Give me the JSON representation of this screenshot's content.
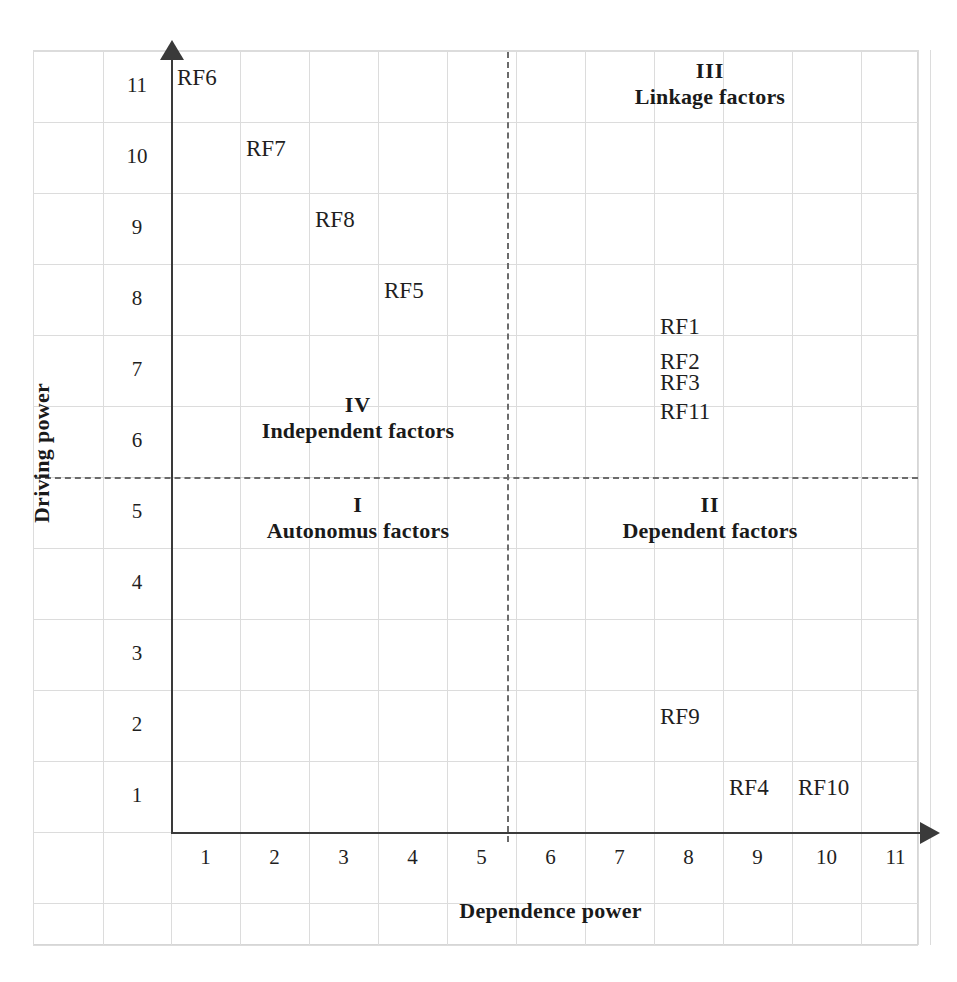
{
  "chart_data": {
    "type": "scatter",
    "title": "",
    "xlabel": "Dependence power",
    "ylabel": "Driving power",
    "xlim": [
      0,
      11
    ],
    "ylim": [
      0,
      11
    ],
    "xticks": [
      "1",
      "2",
      "3",
      "4",
      "5",
      "6",
      "7",
      "8",
      "9",
      "10",
      "11"
    ],
    "yticks": [
      "1",
      "2",
      "3",
      "4",
      "5",
      "6",
      "7",
      "8",
      "9",
      "10",
      "11"
    ],
    "grid": true,
    "legend": "none",
    "divider_x": 5.5,
    "divider_y": 5.5,
    "points": [
      {
        "label": "RF6",
        "x": 1,
        "y": 11
      },
      {
        "label": "RF7",
        "x": 2,
        "y": 10
      },
      {
        "label": "RF8",
        "x": 3,
        "y": 9
      },
      {
        "label": "RF5",
        "x": 4,
        "y": 8
      },
      {
        "label": "RF1",
        "x": 8,
        "y": 7.5
      },
      {
        "label": "RF2",
        "x": 8,
        "y": 7
      },
      {
        "label": "RF3",
        "x": 8,
        "y": 6.7
      },
      {
        "label": "RF11",
        "x": 8,
        "y": 6.3
      },
      {
        "label": "RF9",
        "x": 8,
        "y": 2
      },
      {
        "label": "RF4",
        "x": 9,
        "y": 1
      },
      {
        "label": "RF10",
        "x": 10,
        "y": 1
      }
    ],
    "quadrants": [
      {
        "id": "I",
        "roman": "I",
        "name": "Autonomus factors",
        "position": "bottom-left"
      },
      {
        "id": "II",
        "roman": "II",
        "name": "Dependent factors",
        "position": "bottom-right"
      },
      {
        "id": "III",
        "roman": "III",
        "name": "Linkage factors",
        "position": "top-right"
      },
      {
        "id": "IV",
        "roman": "IV",
        "name": "Independent factors",
        "position": "top-left"
      }
    ]
  },
  "axes": {
    "x_title": "Dependence power",
    "y_title": "Driving power"
  },
  "quadrant_labels": {
    "q1_roman": "I",
    "q1_name": "Autonomus factors",
    "q2_roman": "II",
    "q2_name": "Dependent factors",
    "q3_roman": "III",
    "q3_name": "Linkage factors",
    "q4_roman": "IV",
    "q4_name": "Independent factors"
  },
  "ticks": {
    "x": [
      "1",
      "2",
      "3",
      "4",
      "5",
      "6",
      "7",
      "8",
      "9",
      "10",
      "11"
    ],
    "y": [
      "11",
      "10",
      "9",
      "8",
      "7",
      "6",
      "5",
      "4",
      "3",
      "2",
      "1"
    ]
  },
  "factors": [
    {
      "label": "RF6"
    },
    {
      "label": "RF7"
    },
    {
      "label": "RF8"
    },
    {
      "label": "RF5"
    },
    {
      "label": "RF1"
    },
    {
      "label": "RF2"
    },
    {
      "label": "RF3"
    },
    {
      "label": "RF11"
    },
    {
      "label": "RF9"
    },
    {
      "label": "RF4"
    },
    {
      "label": "RF10"
    }
  ],
  "colors": {
    "axis": "#3a3a3a",
    "grid": "#dcdcdc",
    "dashed": "#6b6b6b",
    "text": "#1f1f1f",
    "background": "#ffffff"
  }
}
